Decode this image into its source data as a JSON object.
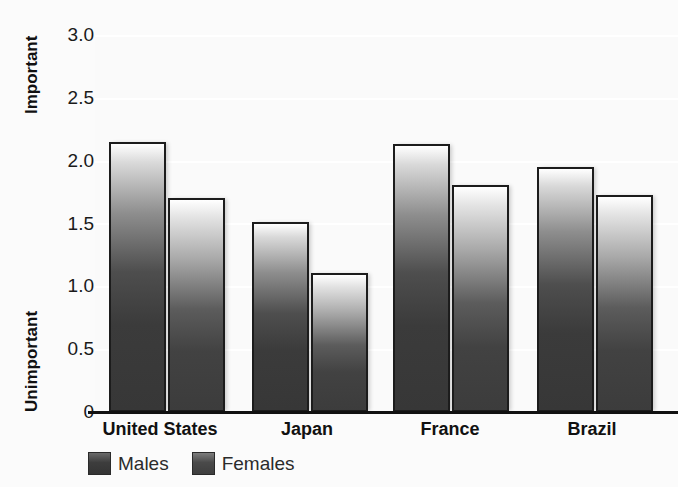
{
  "axis": {
    "top_annotation": "Important",
    "bottom_annotation": "Unimportant",
    "y_ticks": [
      "3.0",
      "2.5",
      "2.0",
      "1.5",
      "1.0",
      "0.5",
      "0"
    ]
  },
  "legend": {
    "items": [
      {
        "label": "Males",
        "swatch": "males-swatch-icon"
      },
      {
        "label": "Females",
        "swatch": "females-swatch-icon"
      }
    ]
  },
  "chart_data": {
    "type": "bar",
    "title": "",
    "xlabel": "",
    "ylabel": "",
    "ylim": [
      0,
      3.0
    ],
    "y_tick_values": [
      3.0,
      2.5,
      2.0,
      1.5,
      1.0,
      0.5,
      0
    ],
    "y_axis_low_annotation": "Unimportant",
    "y_axis_high_annotation": "Important",
    "grid": true,
    "grid_axis": "y",
    "legend_position": "bottom-left",
    "categories": [
      "United States",
      "Japan",
      "France",
      "Brazil"
    ],
    "series": [
      {
        "name": "Males",
        "values": [
          2.15,
          1.51,
          2.13,
          1.95
        ]
      },
      {
        "name": "Females",
        "values": [
          1.7,
          1.11,
          1.81,
          1.73
        ]
      }
    ]
  }
}
